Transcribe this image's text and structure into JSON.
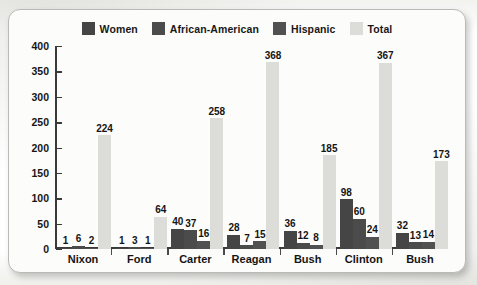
{
  "chart_data": {
    "type": "bar",
    "title": "",
    "subtitle": "",
    "xlabel": "",
    "ylabel": "",
    "ylim": [
      0,
      400
    ],
    "yticks": [
      0,
      50,
      100,
      150,
      200,
      250,
      300,
      350,
      400
    ],
    "ytick_labels": [
      "0",
      "50",
      "100",
      "150",
      "200",
      "250",
      "300",
      "350",
      "400"
    ],
    "grid": false,
    "legend_position": "top-center",
    "categories": [
      "Nixon",
      "Ford",
      "Carter",
      "Reagan",
      "Bush",
      "Clinton",
      "Bush"
    ],
    "series": [
      {
        "name": "Women",
        "color": "#454545",
        "values": [
          1,
          1,
          40,
          28,
          36,
          98,
          32
        ],
        "labels": [
          "1",
          "1",
          "40",
          "28",
          "36",
          "98",
          "32"
        ]
      },
      {
        "name": "African-American",
        "color": "#4b4b4b",
        "values": [
          6,
          3,
          37,
          7,
          12,
          60,
          13
        ],
        "labels": [
          "6",
          "3",
          "37",
          "7",
          "12",
          "60",
          "13"
        ]
      },
      {
        "name": "Hispanic",
        "color": "#515151",
        "values": [
          2,
          1,
          16,
          15,
          8,
          24,
          14
        ],
        "labels": [
          "2",
          "1",
          "16",
          "15",
          "8",
          "24",
          "14"
        ]
      },
      {
        "name": "Total",
        "color": "#dcdcd8",
        "values": [
          224,
          64,
          258,
          368,
          185,
          367,
          173
        ],
        "labels": [
          "224",
          "64",
          "258",
          "368",
          "185",
          "367",
          "173"
        ]
      }
    ]
  },
  "legend": {
    "items": [
      {
        "label": "Women",
        "color": "#454545"
      },
      {
        "label": "African-American",
        "color": "#4b4b4b"
      },
      {
        "label": "Hispanic",
        "color": "#515151"
      },
      {
        "label": "Total",
        "color": "#dcdcd8"
      }
    ]
  },
  "colors": {
    "axis": "#3a3a3a",
    "text": "#141414",
    "card_background": "#fcfcfb",
    "card_border": "#b9b9b5",
    "page_background": "#fdfdfc"
  }
}
